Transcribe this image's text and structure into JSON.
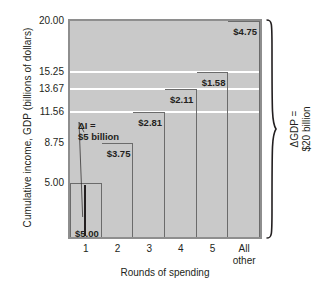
{
  "chart_data": {
    "type": "bar",
    "title": "",
    "subtitle": "",
    "xlabel": "Rounds of spending",
    "ylabel": "Cumulative income, GDP (billions of dollars)",
    "categories": [
      "1",
      "2",
      "3",
      "4",
      "5",
      "All other"
    ],
    "category_lines": [
      [
        "1"
      ],
      [
        "2"
      ],
      [
        "3"
      ],
      [
        "4"
      ],
      [
        "5"
      ],
      [
        "All",
        "other"
      ]
    ],
    "increments": [
      5.0,
      3.75,
      2.81,
      2.11,
      1.58,
      4.75
    ],
    "increment_labels": [
      "$5.00",
      "$3.75",
      "$2.81",
      "$2.11",
      "$1.58",
      "$4.75"
    ],
    "cumulative": [
      5.0,
      8.75,
      11.56,
      13.67,
      15.25,
      20.0
    ],
    "ylim": [
      0,
      20
    ],
    "ytick_values": [
      5.0,
      8.75,
      11.56,
      13.67,
      15.25,
      20.0
    ],
    "ytick_labels": [
      "5.00",
      "8.75",
      "11.56",
      "13.67",
      "15.25",
      "20.00"
    ],
    "gridlines": [
      "11.56",
      "13.67",
      "15.25"
    ],
    "grid": true,
    "legend": "none",
    "plot_background_color": "#c9c9c9",
    "gridline_color": "#ffffff",
    "step_outline_color": "#6b6b6b",
    "text_color": "#231f20",
    "annotations": [
      {
        "name": "delta-i-annotation",
        "line1": "ΔI =",
        "line2": "$5 billion",
        "points_to": "base of round 1 bar"
      },
      {
        "name": "delta-gdp-annotation",
        "line1": "ΔGDP =",
        "line2": "$20 billion",
        "orientation": "vertical-right-brace"
      }
    ]
  },
  "axes": {
    "y_title": "Cumulative income, GDP (billions of dollars)",
    "x_title": "Rounds of spending"
  },
  "annotation": {
    "di_line1": "ΔI =",
    "di_line2": "$5 billion",
    "gdp_line1": "ΔGDP =",
    "gdp_line2": "$20 billion"
  }
}
